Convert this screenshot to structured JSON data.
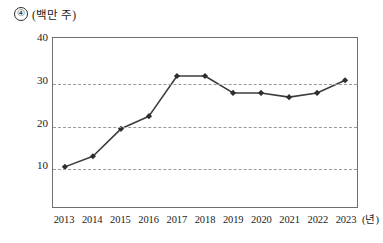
{
  "header": {
    "item_number": "④",
    "unit_y": "(백만 주)"
  },
  "axes": {
    "unit_x": "(년)",
    "y_ticks": [
      "10",
      "20",
      "30",
      "40"
    ],
    "x_ticks": [
      "2013",
      "2014",
      "2015",
      "2016",
      "2017",
      "2018",
      "2019",
      "2020",
      "2021",
      "2022",
      "2023"
    ]
  },
  "style": {
    "line_color": "#3c3c3c",
    "marker_color": "#2e2e2e",
    "grid_color": "#9a9a9a",
    "frame_color": "#6f6f6f"
  },
  "chart_data": {
    "type": "line",
    "title": "④ (백만 주)",
    "subtitle": "",
    "xlabel": "(년)",
    "ylabel": "(백만 주)",
    "categories": [
      "2013",
      "2014",
      "2015",
      "2016",
      "2017",
      "2018",
      "2019",
      "2020",
      "2021",
      "2022",
      "2023"
    ],
    "x": [
      2013,
      2014,
      2015,
      2016,
      2017,
      2018,
      2019,
      2020,
      2021,
      2022,
      2023
    ],
    "values": [
      9.5,
      12,
      18.5,
      21.5,
      31,
      31,
      27,
      27,
      26,
      27,
      30
    ],
    "series": [
      {
        "name": "발행주식수",
        "values": [
          9.5,
          12,
          18.5,
          21.5,
          31,
          31,
          27,
          27,
          26,
          27,
          30
        ]
      }
    ],
    "ylim": [
      0,
      40
    ],
    "yticks": [
      10,
      20,
      30,
      40
    ],
    "grid": true,
    "grid_axis": "y",
    "legend": "none",
    "marker": "diamond"
  }
}
